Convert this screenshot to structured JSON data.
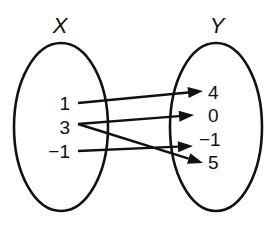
{
  "diagram": {
    "type": "mapping-diagram",
    "domain_set": {
      "label": "X",
      "elements": [
        "1",
        "3",
        "−1"
      ]
    },
    "range_set": {
      "label": "Y",
      "elements": [
        "4",
        "0",
        "−1",
        "5"
      ]
    },
    "mappings": [
      {
        "from": "1",
        "to": "4"
      },
      {
        "from": "3",
        "to": "0"
      },
      {
        "from": "3",
        "to": "5"
      },
      {
        "from": "−1",
        "to": "−1"
      }
    ]
  }
}
